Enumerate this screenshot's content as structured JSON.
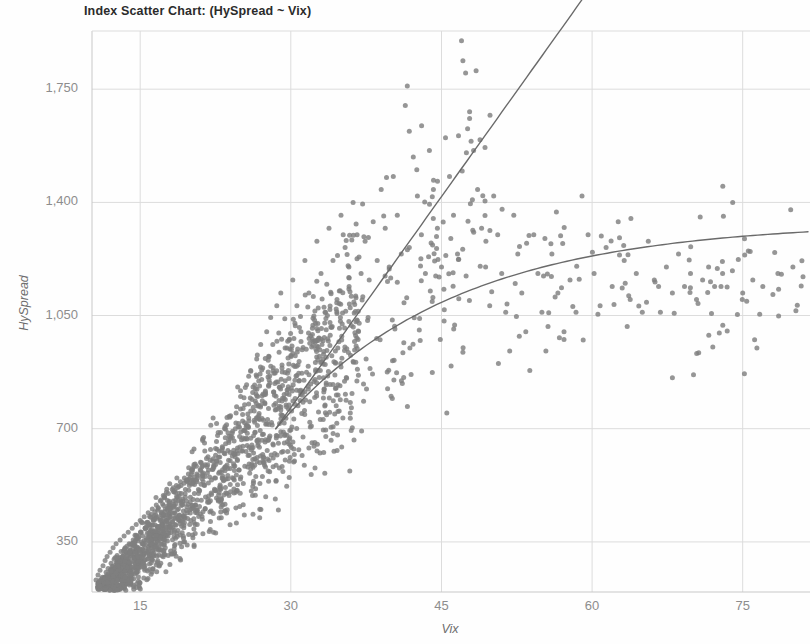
{
  "chart_data": {
    "type": "scatter",
    "title": "Index Scatter Chart: (HySpread ~ Vix)",
    "xlabel": "Vix",
    "ylabel": "HySpread",
    "xlim": [
      10.2,
      81.7
    ],
    "ylim": [
      195,
      1930
    ],
    "xticks": [
      15,
      30,
      45,
      60,
      75
    ],
    "xtick_labels": [
      "15",
      "30",
      "45",
      "60",
      "75"
    ],
    "yticks": [
      350,
      700,
      1050,
      1400,
      1750
    ],
    "ytick_labels": [
      "350",
      "700",
      "1,050",
      "1,400",
      "1,750"
    ],
    "grid": true,
    "legend": "none",
    "point_color": "#7f7f7f",
    "point_size": 5,
    "grid_color": "#dcdcdc",
    "axis_color": "#c8c8c8",
    "text_color": "#8d8d8d",
    "title_color": "#2b2b2b",
    "fit_color": "#6a6a6a",
    "series": [
      {
        "name": "observations",
        "points": [
          [
            10.6,
            232
          ],
          [
            10.8,
            248
          ],
          [
            11.0,
            262
          ],
          [
            11.1,
            221
          ],
          [
            11.3,
            276
          ],
          [
            11.4,
            240
          ],
          [
            11.5,
            292
          ],
          [
            11.6,
            256
          ],
          [
            11.7,
            305
          ],
          [
            11.8,
            268
          ],
          [
            11.9,
            228
          ],
          [
            12.0,
            318
          ],
          [
            12.1,
            284
          ],
          [
            12.2,
            246
          ],
          [
            12.3,
            332
          ],
          [
            12.4,
            296
          ],
          [
            12.5,
            258
          ],
          [
            12.6,
            344
          ],
          [
            12.7,
            308
          ],
          [
            12.8,
            272
          ],
          [
            12.9,
            236
          ],
          [
            13.0,
            356
          ],
          [
            13.1,
            320
          ],
          [
            13.2,
            284
          ],
          [
            13.3,
            248
          ],
          [
            13.4,
            368
          ],
          [
            13.5,
            332
          ],
          [
            13.6,
            296
          ],
          [
            13.7,
            260
          ],
          [
            13.8,
            380
          ],
          [
            13.9,
            344
          ],
          [
            14.0,
            308
          ],
          [
            14.1,
            272
          ],
          [
            14.2,
            392
          ],
          [
            14.3,
            356
          ],
          [
            14.4,
            320
          ],
          [
            14.5,
            284
          ],
          [
            14.6,
            404
          ],
          [
            14.7,
            368
          ],
          [
            14.8,
            332
          ],
          [
            14.9,
            296
          ],
          [
            15.0,
            416
          ],
          [
            15.1,
            380
          ],
          [
            15.2,
            344
          ],
          [
            15.3,
            308
          ],
          [
            15.4,
            428
          ],
          [
            15.5,
            392
          ],
          [
            15.6,
            356
          ],
          [
            15.7,
            320
          ],
          [
            15.8,
            440
          ],
          [
            15.9,
            404
          ],
          [
            16.0,
            368
          ],
          [
            16.1,
            332
          ],
          [
            16.2,
            452
          ],
          [
            16.3,
            416
          ],
          [
            16.4,
            380
          ],
          [
            16.5,
            344
          ],
          [
            16.6,
            464
          ],
          [
            16.7,
            428
          ],
          [
            16.8,
            392
          ],
          [
            16.9,
            356
          ],
          [
            17.0,
            476
          ],
          [
            17.1,
            440
          ],
          [
            17.2,
            404
          ],
          [
            17.3,
            368
          ],
          [
            17.4,
            488
          ],
          [
            17.5,
            452
          ],
          [
            17.6,
            416
          ],
          [
            17.7,
            380
          ],
          [
            17.8,
            500
          ],
          [
            17.9,
            464
          ],
          [
            18.0,
            428
          ],
          [
            18.1,
            392
          ],
          [
            18.2,
            512
          ],
          [
            18.3,
            476
          ],
          [
            18.4,
            440
          ],
          [
            18.5,
            404
          ],
          [
            18.6,
            524
          ],
          [
            18.7,
            488
          ],
          [
            18.8,
            452
          ],
          [
            18.9,
            416
          ],
          [
            19.0,
            536
          ],
          [
            19.1,
            500
          ],
          [
            19.2,
            464
          ],
          [
            19.3,
            428
          ],
          [
            19.4,
            548
          ],
          [
            19.5,
            512
          ],
          [
            19.6,
            476
          ],
          [
            19.7,
            440
          ],
          [
            19.8,
            560
          ],
          [
            19.9,
            524
          ],
          [
            20.0,
            488
          ],
          [
            20.1,
            452
          ],
          [
            20.2,
            572
          ],
          [
            20.3,
            536
          ],
          [
            20.4,
            500
          ],
          [
            20.5,
            464
          ],
          [
            20.6,
            584
          ],
          [
            20.7,
            548
          ],
          [
            20.8,
            512
          ],
          [
            21.0,
            596
          ],
          [
            21.2,
            560
          ],
          [
            21.4,
            524
          ],
          [
            21.6,
            608
          ],
          [
            21.8,
            572
          ],
          [
            22.0,
            636
          ],
          [
            22.2,
            600
          ],
          [
            22.4,
            548
          ],
          [
            22.6,
            660
          ],
          [
            22.8,
            612
          ],
          [
            23.0,
            688
          ],
          [
            23.2,
            640
          ],
          [
            23.4,
            580
          ],
          [
            23.6,
            712
          ],
          [
            23.8,
            664
          ],
          [
            24.0,
            740
          ],
          [
            24.2,
            692
          ],
          [
            24.4,
            620
          ],
          [
            24.6,
            768
          ],
          [
            24.8,
            716
          ],
          [
            25.0,
            800
          ],
          [
            25.2,
            744
          ],
          [
            25.4,
            668
          ],
          [
            25.6,
            836
          ],
          [
            25.8,
            776
          ],
          [
            26.0,
            880
          ],
          [
            26.2,
            812
          ],
          [
            26.4,
            720
          ],
          [
            26.6,
            916
          ],
          [
            26.8,
            848
          ],
          [
            27.0,
            960
          ],
          [
            27.2,
            888
          ],
          [
            27.4,
            780
          ],
          [
            27.6,
            1000
          ],
          [
            27.8,
            924
          ],
          [
            28.0,
            1044
          ],
          [
            28.2,
            960
          ],
          [
            28.4,
            840
          ],
          [
            28.6,
            1080
          ],
          [
            28.8,
            996
          ],
          [
            29.0,
            1120
          ],
          [
            29.4,
            1040
          ],
          [
            29.8,
            900
          ],
          [
            30.2,
            1160
          ],
          [
            30.6,
            1080
          ],
          [
            31.0,
            1000
          ],
          [
            31.4,
            1220
          ],
          [
            31.8,
            1120
          ],
          [
            32.2,
            1020
          ],
          [
            32.6,
            1280
          ],
          [
            33.0,
            1180
          ],
          [
            33.4,
            1060
          ],
          [
            33.8,
            1320
          ],
          [
            34.2,
            1220
          ],
          [
            34.6,
            1100
          ],
          [
            35.0,
            1360
          ],
          [
            35.4,
            1260
          ],
          [
            35.8,
            1140
          ],
          [
            36.2,
            1400
          ],
          [
            36.6,
            1300
          ],
          [
            37.0,
            1180
          ],
          [
            37.4,
            1280
          ],
          [
            37.8,
            1160
          ],
          [
            38.2,
            1340
          ],
          [
            38.6,
            1220
          ],
          [
            39.0,
            1440
          ],
          [
            39.4,
            1320
          ],
          [
            39.8,
            1200
          ],
          [
            40.2,
            1480
          ],
          [
            40.6,
            1360
          ],
          [
            41.0,
            1240
          ],
          [
            41.4,
            1700
          ],
          [
            41.6,
            1760
          ],
          [
            41.8,
            1620
          ],
          [
            42.2,
            1540
          ],
          [
            42.6,
            1420
          ],
          [
            43.0,
            1300
          ],
          [
            43.4,
            1180
          ],
          [
            43.8,
            1560
          ],
          [
            44.2,
            1440
          ],
          [
            44.6,
            1320
          ],
          [
            45.0,
            1200
          ],
          [
            45.4,
            1600
          ],
          [
            45.8,
            1480
          ],
          [
            46.2,
            1360
          ],
          [
            46.6,
            1240
          ],
          [
            47.0,
            1900
          ],
          [
            47.4,
            1800
          ],
          [
            47.8,
            1680
          ],
          [
            48.2,
            1560
          ],
          [
            48.6,
            1440
          ],
          [
            49.0,
            1320
          ],
          [
            49.4,
            1200
          ],
          [
            49.8,
            1080
          ],
          [
            50.2,
            1420
          ],
          [
            50.6,
            1300
          ],
          [
            51.0,
            1180
          ],
          [
            51.4,
            1060
          ],
          [
            51.8,
            940
          ],
          [
            52.2,
            1360
          ],
          [
            52.6,
            1240
          ],
          [
            53.0,
            1120
          ],
          [
            53.4,
            1000
          ],
          [
            53.8,
            880
          ],
          [
            54.2,
            1300
          ],
          [
            54.6,
            1180
          ],
          [
            55.0,
            1060
          ],
          [
            55.4,
            940
          ],
          [
            56.0,
            1240
          ],
          [
            56.6,
            1120
          ],
          [
            57.2,
            1000
          ],
          [
            57.8,
            1160
          ],
          [
            58.4,
            1060
          ],
          [
            59.0,
            1420
          ],
          [
            59.6,
            1300
          ],
          [
            60.2,
            1180
          ],
          [
            60.8,
            1080
          ],
          [
            61.4,
            1260
          ],
          [
            62.0,
            1140
          ],
          [
            62.6,
            1340
          ],
          [
            63.2,
            1220
          ],
          [
            63.8,
            1100
          ],
          [
            64.4,
            1180
          ],
          [
            65.0,
            1060
          ],
          [
            65.6,
            1280
          ],
          [
            66.2,
            1160
          ],
          [
            66.8,
            1060
          ],
          [
            67.4,
            1200
          ],
          [
            68.0,
            1120
          ],
          [
            68.6,
            1240
          ],
          [
            69.2,
            1140
          ],
          [
            69.8,
            1180
          ],
          [
            70.4,
            1100
          ],
          [
            71.0,
            1160
          ],
          [
            71.6,
            1200
          ],
          [
            72.2,
            1140
          ],
          [
            73.0,
            1180
          ],
          [
            74.0,
            1400
          ],
          [
            75.0,
            1120
          ],
          [
            76.0,
            1160
          ],
          [
            77.0,
            1140
          ],
          [
            78.5,
            1180
          ],
          [
            80.0,
            1200
          ],
          [
            81.0,
            1170
          ]
        ]
      }
    ],
    "fits": [
      {
        "name": "linear-fit",
        "kind": "line"
      },
      {
        "name": "loess-fit",
        "kind": "curve"
      }
    ]
  }
}
